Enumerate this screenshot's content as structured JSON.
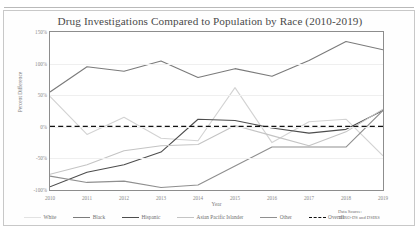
{
  "figure": {
    "title": "Drug Investigations Compared to Population by Race (2010-2019)",
    "source_line_1": "Data Source:",
    "source_line_2": "THRO-DS and DSIRS"
  },
  "axes": {
    "x_title": "Year",
    "y_title": "Percent Difference",
    "y_ticks": [
      "150%",
      "100%",
      "50%",
      "0%",
      "-50%",
      "-100%"
    ],
    "x_ticks": [
      "2010",
      "2011",
      "2012",
      "2013",
      "2014",
      "2015",
      "2016",
      "2017",
      "2018",
      "2019"
    ]
  },
  "legend": {
    "items": [
      {
        "label": "White",
        "color": "#d3d3d3",
        "dash": false
      },
      {
        "label": "Black",
        "color": "#7b7b7b",
        "dash": false
      },
      {
        "label": "Hispanic",
        "color": "#4d4d4d",
        "dash": false
      },
      {
        "label": "Asian Pacific Islander",
        "color": "#c4c4c4",
        "dash": false
      },
      {
        "label": "Other",
        "color": "#8f8f8f",
        "dash": false
      },
      {
        "label": "Overall",
        "color": "#111111",
        "dash": true
      }
    ]
  },
  "chart_data": {
    "type": "line",
    "title": "Drug Investigations Compared to Population by Race (2010-2019)",
    "xlabel": "Year",
    "ylabel": "Percent Difference",
    "x": [
      2010,
      2011,
      2012,
      2013,
      2014,
      2015,
      2016,
      2017,
      2018,
      2019
    ],
    "xlim": [
      2010,
      2019
    ],
    "ylim": [
      -100,
      150
    ],
    "ytick_values": [
      150,
      100,
      50,
      0,
      -50,
      -100
    ],
    "grid": true,
    "legend_position": "bottom",
    "series": [
      {
        "name": "White",
        "color": "#d3d3d3",
        "dash": false,
        "values": [
          48,
          -12,
          15,
          -18,
          -22,
          62,
          -25,
          8,
          12,
          -46
        ]
      },
      {
        "name": "Black",
        "color": "#7b7b7b",
        "dash": false,
        "values": [
          55,
          95,
          88,
          104,
          78,
          92,
          80,
          105,
          135,
          122
        ]
      },
      {
        "name": "Hispanic",
        "color": "#4d4d4d",
        "dash": false,
        "values": [
          -95,
          -72,
          -60,
          -40,
          12,
          10,
          -2,
          -10,
          -4,
          26
        ]
      },
      {
        "name": "Asian Pacific Islander",
        "color": "#c4c4c4",
        "dash": false,
        "values": [
          -75,
          -60,
          -38,
          -30,
          -28,
          2,
          -14,
          -30,
          -8,
          28
        ]
      },
      {
        "name": "Other",
        "color": "#8f8f8f",
        "dash": false,
        "values": [
          -78,
          -88,
          -86,
          -96,
          -92,
          -62,
          -32,
          -32,
          -32,
          26
        ]
      },
      {
        "name": "Overall",
        "color": "#111111",
        "dash": true,
        "values": [
          0,
          0,
          0,
          0,
          0,
          0,
          0,
          0,
          0,
          0
        ]
      }
    ]
  }
}
